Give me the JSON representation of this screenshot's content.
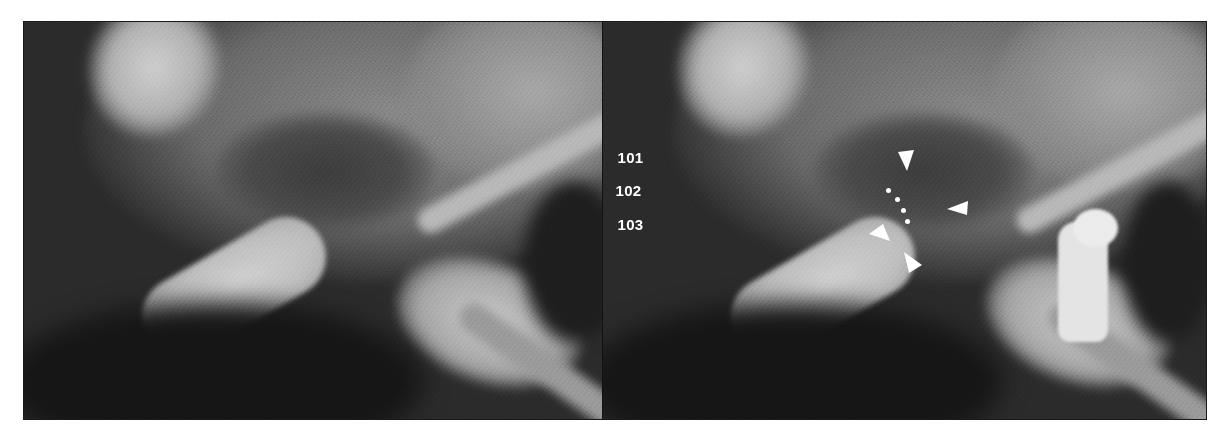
{
  "figure": {
    "panels": [
      {
        "id": "left",
        "description": "radiograph without annotations"
      },
      {
        "id": "right",
        "description": "radiograph with annotations"
      }
    ],
    "labels": [
      "101",
      "102",
      "103"
    ],
    "annotations": {
      "arrowheads": 4,
      "dotted_line_points": 4
    },
    "colors": {
      "annotation": "#ffffff",
      "frame": "#1a1a1a",
      "background": "#ffffff"
    }
  }
}
